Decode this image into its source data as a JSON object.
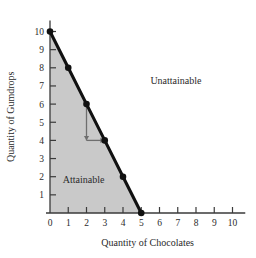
{
  "chart_data": {
    "type": "line",
    "title": "",
    "xlabel": "Quantity of Chocolates",
    "ylabel": "Quantity of Gumdrops",
    "xlim": [
      0,
      10.7
    ],
    "ylim": [
      0,
      10.6
    ],
    "grid": false,
    "legend": "none",
    "x_ticks": [
      "0",
      "1",
      "2",
      "3",
      "4",
      "5",
      "6",
      "7",
      "8",
      "9",
      "10"
    ],
    "x_tick_values": [
      0,
      1,
      2,
      3,
      4,
      5,
      6,
      7,
      8,
      9,
      10
    ],
    "y_ticks": [
      "1",
      "2",
      "3",
      "4",
      "5",
      "6",
      "7",
      "8",
      "9",
      "10"
    ],
    "y_tick_values": [
      1,
      2,
      3,
      4,
      5,
      6,
      7,
      8,
      9,
      10
    ],
    "series": [
      {
        "name": "Production possibilities frontier",
        "x": [
          0,
          1,
          2,
          3,
          4,
          5
        ],
        "values": [
          10,
          8,
          6,
          4,
          2,
          0
        ],
        "marker": "filled-circle",
        "color": "#111111"
      }
    ],
    "shaded_region": {
      "label": "Attainable",
      "color": "#c9c9c9",
      "polygon_x": [
        0,
        0,
        1,
        2,
        3,
        4,
        5
      ],
      "polygon_y": [
        0,
        10,
        8,
        6,
        4,
        2,
        0
      ]
    },
    "annotations": [
      {
        "text": "Unattainable",
        "x": 5.5,
        "y": 7.1
      },
      {
        "text": "Attainable",
        "x": 0.7,
        "y": 1.65
      },
      {
        "text": "",
        "type": "arrow",
        "from_x": 2,
        "from_y": 6,
        "to_x": 2,
        "to_y": 4
      },
      {
        "text": "",
        "type": "arrow",
        "from_x": 2,
        "from_y": 4,
        "to_x": 3,
        "to_y": 4
      }
    ]
  },
  "axes": {
    "x_title": "Quantity of Chocolates",
    "y_title": "Quantity of Gumdrops"
  },
  "labels": {
    "unattainable": "Unattainable",
    "attainable": "Attainable"
  },
  "colors": {
    "shading": "#c9c9c9",
    "frontier": "#111111",
    "axis": "#3a3a3a",
    "arrow": "#6e6e6e",
    "background": "#ffffff"
  }
}
